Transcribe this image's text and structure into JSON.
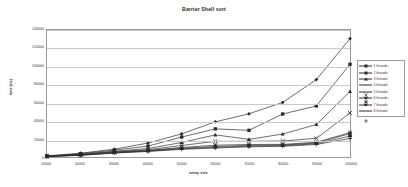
{
  "chart_data": {
    "type": "line",
    "title": "Barrier Shell sort",
    "xlabel": "array size",
    "ylabel": "time (ms)",
    "xlim": [
      10000,
      100000
    ],
    "ylim": [
      0,
      140000
    ],
    "grid": true,
    "legend_position": "right",
    "x": [
      10000,
      20000,
      30000,
      40000,
      50000,
      60000,
      70000,
      80000,
      90000,
      100000
    ],
    "xticklabels": [
      "10000",
      "20000",
      "30000",
      "40000",
      "50000",
      "60000",
      "70000",
      "80000",
      "90000",
      "100000"
    ],
    "yticks": [
      0,
      20000,
      40000,
      60000,
      80000,
      100000,
      120000,
      140000
    ],
    "yticklabels": [
      "0",
      "20000",
      "40000",
      "60000",
      "80000",
      "100000",
      "120000",
      "140000"
    ],
    "series": [
      {
        "name": "1 threads",
        "marker": "diamond",
        "values": [
          1200,
          4200,
          8600,
          15400,
          25500,
          38800,
          47600,
          60100,
          85300,
          130500
        ]
      },
      {
        "name": "2 threads",
        "marker": "square",
        "values": [
          1000,
          3600,
          7600,
          12000,
          22000,
          31000,
          29400,
          47400,
          56300,
          102200
        ]
      },
      {
        "name": "3 threads",
        "marker": "triangle",
        "values": [
          900,
          3100,
          6400,
          9300,
          16000,
          24400,
          19400,
          25300,
          35800,
          72200
        ]
      },
      {
        "name": "4 threads",
        "marker": "cross",
        "values": [
          800,
          2800,
          5800,
          8000,
          12700,
          17200,
          17300,
          17600,
          20600,
          48500
        ]
      },
      {
        "name": "5 threads",
        "marker": "star",
        "values": [
          700,
          2400,
          5200,
          7200,
          10500,
          13000,
          13800,
          13900,
          16200,
          26900
        ]
      },
      {
        "name": "6 threads",
        "marker": "circle",
        "values": [
          650,
          2200,
          4900,
          6900,
          9700,
          11600,
          12800,
          13200,
          15400,
          25800
        ]
      },
      {
        "name": "7 threads",
        "marker": "bar",
        "values": [
          600,
          2000,
          4600,
          6500,
          9000,
          10600,
          11900,
          12500,
          14600,
          23000
        ]
      },
      {
        "name": "8 threads",
        "marker": "plus",
        "values": [
          550,
          1800,
          4300,
          6100,
          8400,
          9900,
          11200,
          11800,
          13800,
          20400
        ]
      }
    ]
  }
}
